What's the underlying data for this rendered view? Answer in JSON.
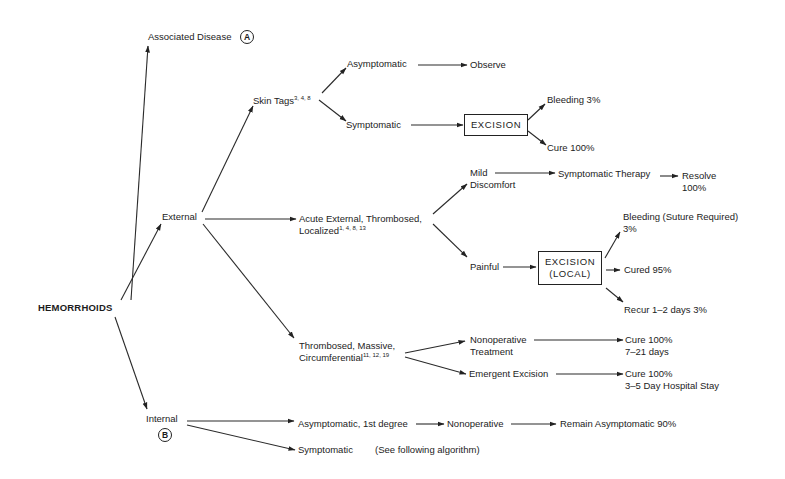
{
  "diagram": {
    "type": "decision-tree",
    "root": "HEMORRHOIDS",
    "associated_disease": {
      "label": "Associated Disease",
      "marker": "A"
    },
    "external": {
      "label": "External",
      "skin_tags": {
        "label": "Skin Tags",
        "refs": "3, 4, 8",
        "asymptomatic": {
          "label": "Asymptomatic",
          "outcome": "Observe"
        },
        "symptomatic": {
          "label": "Symptomatic",
          "procedure": "EXCISION",
          "outcomes": [
            "Bleeding 3%",
            "Cure 100%"
          ]
        }
      },
      "acute": {
        "label_line1": "Acute External, Thrombosed,",
        "label_line2": "Localized",
        "refs": "1, 4, 8, 13",
        "mild": {
          "label_line1": "Mild",
          "label_line2": "Discomfort",
          "therapy": "Symptomatic Therapy",
          "outcome_line1": "Resolve",
          "outcome_line2": "100%"
        },
        "painful": {
          "label": "Painful",
          "procedure_line1": "EXCISION",
          "procedure_line2": "(LOCAL)",
          "bleeding_line1": "Bleeding (Suture Required)",
          "bleeding_line2": "3%",
          "cured": "Cured 95%",
          "recur": "Recur 1–2 days 3%"
        }
      },
      "massive": {
        "label_line1": "Thrombosed, Massive,",
        "label_line2": "Circumferential",
        "refs": "11, 12, 19",
        "nonoperative": {
          "label_line1": "Nonoperative",
          "label_line2": "Treatment",
          "outcome_line1": "Cure 100%",
          "outcome_line2": "7–21 days"
        },
        "emergent": {
          "label": "Emergent Excision",
          "outcome_line1": "Cure 100%",
          "outcome_line2": "3–5 Day Hospital Stay"
        }
      }
    },
    "internal": {
      "label": "Internal",
      "marker": "B",
      "asymptomatic": {
        "label": "Asymptomatic, 1st degree",
        "treatment": "Nonoperative",
        "outcome": "Remain Asymptomatic 90%"
      },
      "symptomatic": {
        "label": "Symptomatic",
        "note": "(See following algorithm)"
      }
    }
  }
}
